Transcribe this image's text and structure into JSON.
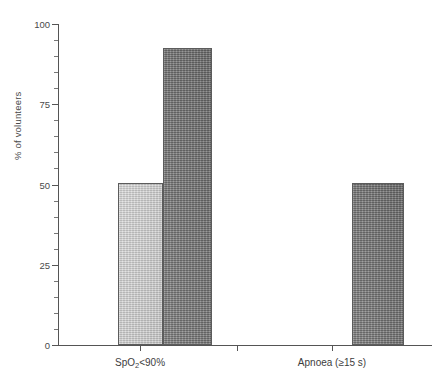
{
  "chart_data": {
    "type": "bar",
    "title": "",
    "xlabel": "",
    "ylabel": "% of volunteers",
    "ylim": [
      0,
      100
    ],
    "yticks": [
      0,
      25,
      50,
      75,
      100
    ],
    "ytick_labels": [
      "0",
      "25",
      "50",
      "75",
      "100"
    ],
    "yminor_ticks": [
      5,
      10,
      15,
      20,
      30,
      35,
      40,
      45,
      55,
      60,
      65,
      70,
      80,
      85,
      90,
      95
    ],
    "grid": false,
    "legend": null,
    "categories": [
      "SpO2<90%",
      "Apnoea (≥15 s)"
    ],
    "category_labels_html": [
      "SpO<sub>2</sub>&lt;90%",
      "Apnoea (≥15 s)"
    ],
    "series": [
      {
        "name": "series-1",
        "color": "#c3c3c3",
        "values": [
          50.5,
          0
        ]
      },
      {
        "name": "series-2",
        "color": "#777777",
        "values": [
          92.5,
          50.5
        ]
      }
    ],
    "bars": [
      {
        "id": "bar-spo2-light",
        "group": "SpO2<90%",
        "series": "series-1",
        "value": 50.5,
        "color": "#c3c3c3",
        "shade": "light",
        "left_px": 118,
        "width_px": 45
      },
      {
        "id": "bar-spo2-dark",
        "group": "SpO2<90%",
        "series": "series-2",
        "value": 92.5,
        "color": "#777777",
        "shade": "dark",
        "left_px": 163,
        "width_px": 49
      },
      {
        "id": "bar-apnoea-dark",
        "group": "Apnoea (≥15 s)",
        "series": "series-2",
        "value": 50.5,
        "color": "#777777",
        "shade": "dark",
        "left_px": 352,
        "width_px": 52
      }
    ],
    "axis_color": "#555555",
    "background": "#ffffff"
  },
  "xtick_positions_px": [
    140,
    237,
    332
  ]
}
